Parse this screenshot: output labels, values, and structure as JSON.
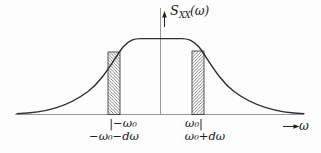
{
  "figure": {
    "title_semantics": "Power spectral density band diagram",
    "y_axis_label": {
      "main": "S",
      "sub": "XX",
      "arg": "(ω)"
    },
    "x_axis_label": "ω",
    "left_band": {
      "tick_label": "|−ω₀",
      "range_label": "−ω₀−dω"
    },
    "right_band": {
      "tick_label": "ω₀|",
      "range_label": "ω₀+dω"
    },
    "colors": {
      "curve": "#2f2f2f",
      "axis": "#999999",
      "hatch": "#555555",
      "band_outline": "#444444",
      "text": "#1a1a1a",
      "background": "#fdfdfd"
    }
  }
}
